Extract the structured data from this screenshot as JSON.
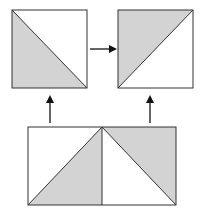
{
  "diagram": {
    "colors": {
      "fill_shaded": "#d3d3d3",
      "fill_blank": "#ffffff",
      "stroke": "#333333",
      "arrow": "#111111"
    },
    "top_left_square": {
      "x": 12,
      "y": 10,
      "w": 75,
      "h": 78,
      "shaded": "lower-left triangle",
      "diagonal": "top-left to bottom-right"
    },
    "top_right_square": {
      "x": 118,
      "y": 10,
      "w": 75,
      "h": 78,
      "shaded": "upper-left triangle",
      "diagonal": "bottom-left to top-right"
    },
    "bottom_rectangle": {
      "x": 28,
      "y": 127,
      "w": 148,
      "h": 78,
      "divider_x": 102,
      "left_half": {
        "shaded": "lower-right triangle",
        "diagonal": "bottom-left to top-right"
      },
      "right_half": {
        "shaded": "upper-right triangle",
        "diagonal": "top-left to bottom-right"
      }
    },
    "arrows": [
      {
        "name": "arrow-right",
        "from": [
          90,
          49
        ],
        "to": [
          115,
          49
        ]
      },
      {
        "name": "arrow-up-left",
        "from": [
          50,
          123
        ],
        "to": [
          50,
          97
        ]
      },
      {
        "name": "arrow-up-right",
        "from": [
          150,
          123
        ],
        "to": [
          150,
          97
        ]
      }
    ]
  }
}
